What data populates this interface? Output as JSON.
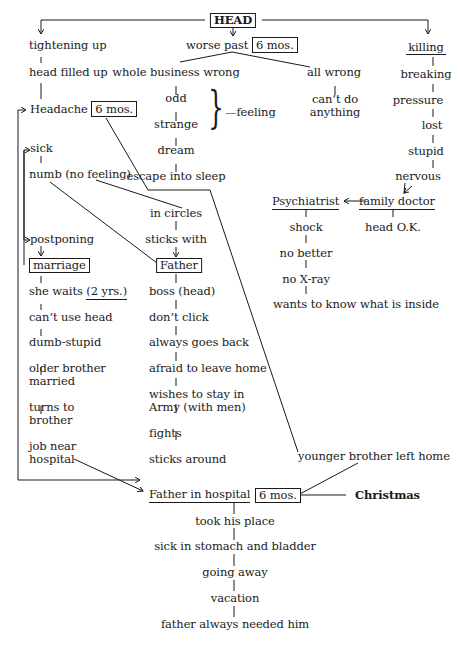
{
  "diagram": {
    "root": "HEAD",
    "center_branch": {
      "label": "worse past",
      "duration": "6 mos.",
      "left": [
        "whole business wrong",
        "odd",
        "strange",
        "dream",
        "escape into sleep"
      ],
      "brace_label": "—feeling",
      "right": [
        "all wrong",
        "can’t do anything"
      ]
    },
    "left_branch": {
      "items": [
        "tightening up",
        "head filled up"
      ],
      "headache": "Headache",
      "headache_duration": "6 mos.",
      "sick": "sick",
      "numb": "numb (no feeling)",
      "postponing": "postponing",
      "marriage": "marriage",
      "she_waits": "she waits",
      "she_waits_duration": "(2 yrs.)",
      "chain": [
        "can’t use head",
        "dumb-stupid",
        "older brother",
        "married",
        "turns to",
        "brother",
        "job near",
        "hospital"
      ]
    },
    "middle_branch": {
      "in_circles": "in circles",
      "sticks_with": "sticks with",
      "father": "Father",
      "chain": [
        "boss (head)",
        "don’t click",
        "always goes back",
        "afraid to leave home",
        "wishes to stay in",
        "Army (with men)",
        "fights",
        "sticks around"
      ]
    },
    "right_branch": {
      "killing": "killing",
      "chain": [
        "breaking",
        "pressure",
        "lost",
        "stupid",
        "nervous"
      ],
      "family_doctor": "family doctor",
      "head_ok": "head O.K.",
      "psychiatrist": "Psychiatrist",
      "psych_chain": [
        "shock",
        "no better",
        "no X-ray",
        "wants to know what is inside"
      ]
    },
    "younger_brother": "younger brother left home",
    "bottom": {
      "father_hospital": "Father in hospital",
      "duration": "6 mos.",
      "christmas": "Christmas",
      "chain": [
        "took his place",
        "sick in stomach and bladder",
        "going away",
        "vacation",
        "father always needed him"
      ]
    }
  }
}
